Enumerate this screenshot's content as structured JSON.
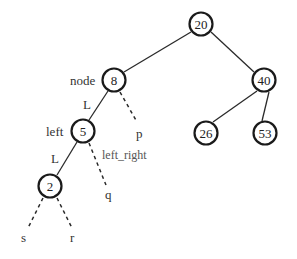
{
  "diagram": {
    "type": "binary-tree",
    "nodes": [
      {
        "id": "n20",
        "value": "20",
        "x": 201,
        "y": 24
      },
      {
        "id": "n8",
        "value": "8",
        "x": 114,
        "y": 80
      },
      {
        "id": "n40",
        "value": "40",
        "x": 264,
        "y": 80
      },
      {
        "id": "n5",
        "value": "5",
        "x": 83,
        "y": 131
      },
      {
        "id": "n26",
        "value": "26",
        "x": 206,
        "y": 133
      },
      {
        "id": "n53",
        "value": "53",
        "x": 265,
        "y": 133
      },
      {
        "id": "n2",
        "value": "2",
        "x": 50,
        "y": 186
      }
    ],
    "edges": [
      {
        "from": "n20",
        "to": "n8",
        "style": "solid"
      },
      {
        "from": "n20",
        "to": "n40",
        "style": "solid"
      },
      {
        "from": "n40",
        "to": "n26",
        "style": "solid"
      },
      {
        "from": "n40",
        "to": "n53",
        "style": "solid"
      },
      {
        "from": "n8",
        "to": "n5",
        "style": "solid",
        "label": "L"
      },
      {
        "from": "n5",
        "to": "n2",
        "style": "solid",
        "label": "L"
      },
      {
        "from": "n8",
        "to": "p",
        "style": "dashed"
      },
      {
        "from": "n5",
        "to": "q",
        "style": "dashed"
      },
      {
        "from": "n2",
        "to": "s",
        "style": "dashed"
      },
      {
        "from": "n2",
        "to": "r",
        "style": "dashed"
      }
    ],
    "labels": {
      "node": "node",
      "left": "left",
      "left_right": "left_right",
      "edge_L1": "L",
      "edge_L2": "L",
      "p": "p",
      "q": "q",
      "s": "s",
      "r": "r"
    },
    "colors": {
      "stroke": "#1a1a1a",
      "text": "#222222",
      "background": "#ffffff"
    }
  }
}
